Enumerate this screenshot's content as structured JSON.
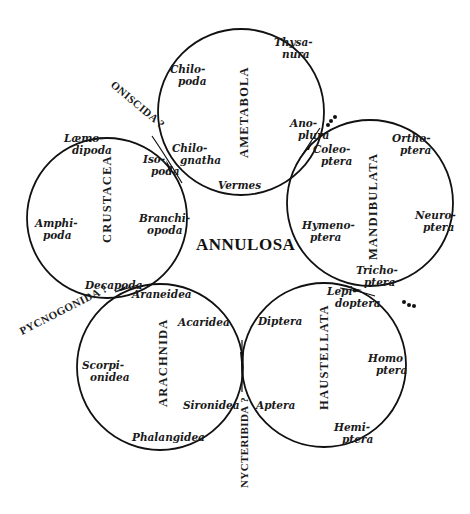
{
  "title": "ANNULOSA",
  "groups": [
    {
      "id": "ametabola",
      "name": "AMETABOLA",
      "center": [
        241,
        112
      ],
      "r": 83,
      "labels": [
        {
          "lines": [
            "Thysa-",
            "nura"
          ],
          "x": 274,
          "y": 46
        },
        {
          "lines": [
            "Chilo-",
            "poda"
          ],
          "x": 170,
          "y": 73
        },
        {
          "lines": [
            "Ano-",
            "plura"
          ],
          "x": 290,
          "y": 127
        },
        {
          "lines": [
            "Chilo-",
            "gnatha"
          ],
          "x": 172,
          "y": 152
        },
        {
          "lines": [
            "Vermes"
          ],
          "x": 218,
          "y": 189
        }
      ]
    },
    {
      "id": "mandibulata",
      "name": "MANDIBULATA",
      "center": [
        370,
        203
      ],
      "r": 83,
      "labels": [
        {
          "lines": [
            "Ortho-",
            "ptera"
          ],
          "x": 392,
          "y": 142
        },
        {
          "lines": [
            "Coleo-",
            "ptera"
          ],
          "x": 313,
          "y": 153
        },
        {
          "lines": [
            "Neuro-",
            "ptera"
          ],
          "x": 415,
          "y": 219
        },
        {
          "lines": [
            "Hymeno-",
            "ptera"
          ],
          "x": 302,
          "y": 229
        },
        {
          "lines": [
            "Tricho-",
            "ptera"
          ],
          "x": 356,
          "y": 274
        }
      ]
    },
    {
      "id": "haustellata",
      "name": "HAUSTELLATA",
      "center": [
        324,
        365
      ],
      "r": 82,
      "labels": [
        {
          "lines": [
            "Lepi-",
            "doptera"
          ],
          "x": 327,
          "y": 295
        },
        {
          "lines": [
            "Diptera"
          ],
          "x": 258,
          "y": 325
        },
        {
          "lines": [
            "Homo",
            "ptera"
          ],
          "x": 368,
          "y": 362
        },
        {
          "lines": [
            "Aptera"
          ],
          "x": 256,
          "y": 409
        },
        {
          "lines": [
            "Hemi-",
            "ptera"
          ],
          "x": 334,
          "y": 431
        }
      ]
    },
    {
      "id": "arachnida",
      "name": "ARACHNIDA",
      "center": [
        160,
        367
      ],
      "r": 83,
      "labels": [
        {
          "lines": [
            "Araneidea"
          ],
          "x": 132,
          "y": 298
        },
        {
          "lines": [
            "Acaridea"
          ],
          "x": 178,
          "y": 326
        },
        {
          "lines": [
            "Scorpi-",
            "onidea"
          ],
          "x": 82,
          "y": 369
        },
        {
          "lines": [
            "Sironidea"
          ],
          "x": 183,
          "y": 409
        },
        {
          "lines": [
            "Phalangidea"
          ],
          "x": 132,
          "y": 441
        }
      ]
    },
    {
      "id": "crustacea",
      "name": "CRUSTACEA",
      "center": [
        107,
        218
      ],
      "r": 80,
      "labels": [
        {
          "lines": [
            "Læmo-",
            "dipoda"
          ],
          "x": 64,
          "y": 142
        },
        {
          "lines": [
            "Iso-",
            "poda"
          ],
          "x": 143,
          "y": 163
        },
        {
          "lines": [
            "Amphi-",
            "poda"
          ],
          "x": 35,
          "y": 227
        },
        {
          "lines": [
            "Branchi-",
            "opoda"
          ],
          "x": 139,
          "y": 222
        },
        {
          "lines": [
            "Decapoda"
          ],
          "x": 85,
          "y": 289
        }
      ]
    }
  ],
  "side_labels": [
    {
      "id": "oniscida",
      "text": "ONISCIDA ?"
    },
    {
      "id": "pycnogonida",
      "text": "PYCNOGONIDA ?"
    },
    {
      "id": "nycteribida",
      "text": "NYCTERIBIDA ?"
    }
  ],
  "dot_marks": [
    {
      "id": "dots-coleoptera",
      "text": "•••"
    },
    {
      "id": "dots-lepidoptera",
      "text": "•••"
    }
  ]
}
